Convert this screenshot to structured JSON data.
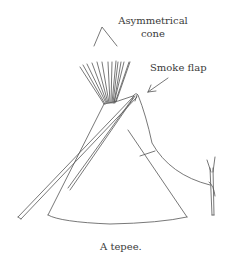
{
  "figure": {
    "labels": {
      "cone_line1": "Asymmetrical",
      "cone_line2": "cone",
      "smoke_flap": "Smoke flap"
    },
    "caption": "A tepee."
  },
  "colors": {
    "ink": "#555555",
    "text": "#3a3a3a",
    "background": "#ffffff"
  }
}
